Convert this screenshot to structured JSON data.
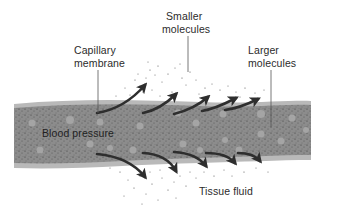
{
  "diagram": {
    "labels": {
      "capillary_membrane": {
        "line1": "Capillary",
        "line2": "membrane"
      },
      "smaller_molecules": {
        "line1": "Smaller",
        "line2": "molecules"
      },
      "larger_molecules": {
        "line1": "Larger",
        "line2": "molecules"
      },
      "blood_pressure": "Blood pressure",
      "tissue_fluid": "Tissue fluid"
    },
    "colors": {
      "vessel_fill": "#8a8a8a",
      "membrane": "#b8b8b8",
      "particle_light": "#a9a9a9",
      "arrow": "#333333",
      "text": "#2b2b2b"
    },
    "arrows_up_count": 5,
    "arrows_down_count": 5
  }
}
